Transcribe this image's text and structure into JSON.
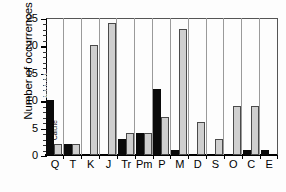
{
  "chart_data": {
    "type": "bar",
    "title": "",
    "xlabel": "",
    "ylabel": "Number of occurrences",
    "ylim": [
      0,
      25
    ],
    "yticks": [
      25,
      20,
      15,
      10,
      5,
      0
    ],
    "grid": false,
    "legend_position": "in-plot-rotated",
    "categories": [
      "Q",
      "T",
      "K",
      "J",
      "Tr",
      "Pm",
      "P",
      "M",
      "D",
      "S",
      "O",
      "C",
      "E"
    ],
    "series": [
      {
        "name": "Aragonite",
        "color": "#0a0a0a",
        "values": [
          10,
          2,
          0,
          0,
          3,
          4,
          12,
          1,
          0,
          0,
          0,
          1,
          1
        ]
      },
      {
        "name": "Calcite",
        "color": "#cfcfcf",
        "values": [
          2,
          2,
          20,
          24,
          4,
          4,
          7,
          23,
          6,
          3,
          9,
          9,
          0
        ]
      }
    ],
    "annotations": [
      {
        "text": "Aragonite",
        "category": "Q",
        "series": "Aragonite"
      },
      {
        "text": "Calcite",
        "category": "Q",
        "series": "Calcite"
      }
    ]
  }
}
